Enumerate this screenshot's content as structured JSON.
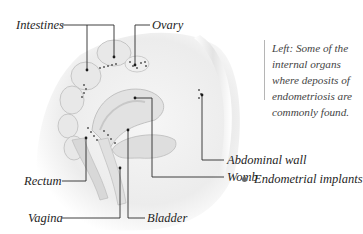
{
  "figure": {
    "labels": {
      "intestines": "Intestines",
      "ovary": "Ovary",
      "abdominal_wall": "Abdominal wall",
      "womb": "Womb",
      "rectum": "Rectum",
      "vagina": "Vagina",
      "bladder": "Bladder"
    },
    "caption": "Left: Some of the internal organs where deposits of endometriosis are commonly found.",
    "legend": {
      "label": "Endometrial implants",
      "marker_color": "#6a6a6a"
    },
    "colors": {
      "leader_line": "#2a2a2a",
      "organ_shading": "#d9d9d9",
      "implant_dots": "#5a5a5a"
    }
  }
}
